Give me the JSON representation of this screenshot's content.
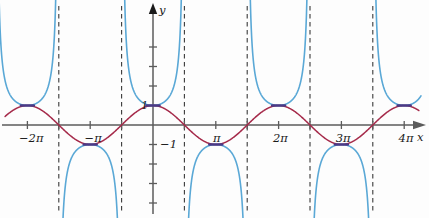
{
  "figure": {
    "background": "#fdfdfd",
    "axis_color": "#5b5b5b",
    "asymptote_color": "#3a3a3a",
    "x_axis_label": "x",
    "y_axis_label": "y"
  },
  "chart_data": {
    "type": "line",
    "title": "",
    "xlabel": "x",
    "ylabel": "y",
    "grid": false,
    "legend": "none",
    "xlim": [
      -7.4,
      13.6
    ],
    "ylim": [
      -4.3,
      4.3
    ],
    "x_tick_values": [
      -6.2832,
      -4.7124,
      -3.1416,
      -1.5708,
      0,
      1.5708,
      3.1416,
      4.7124,
      6.2832,
      7.854,
      9.4248,
      10.9956,
      12.5664
    ],
    "x_tick_labels": [
      "-2π",
      "",
      "-π",
      "",
      "",
      "",
      "π",
      "",
      "2π",
      "",
      "3π",
      "",
      "4π"
    ],
    "x_labeled_ticks": [
      {
        "value": -6.2832,
        "label": "−2π"
      },
      {
        "value": -3.1416,
        "label": "−π"
      },
      {
        "value": 3.1416,
        "label": "π"
      },
      {
        "value": 6.2832,
        "label": "2π"
      },
      {
        "value": 9.4248,
        "label": "3π"
      },
      {
        "value": 12.5664,
        "label": "4π"
      }
    ],
    "y_tick_values": [
      -4,
      -3,
      -2,
      -1,
      1,
      2,
      3,
      4
    ],
    "y_labeled_ticks": [
      {
        "value": 1,
        "label": "1"
      },
      {
        "value": -1,
        "label": "−1"
      }
    ],
    "series": [
      {
        "name": "cosine",
        "expression": "y = cos(x)",
        "color": "#a52a4a",
        "width": 1.5,
        "style": "solid"
      },
      {
        "name": "secant",
        "expression": "y = sec(x)",
        "color": "#5aa8d6",
        "width": 1.6,
        "style": "solid"
      }
    ],
    "asymptotes": {
      "style": "dashed",
      "color": "#3a3a3a",
      "values": [
        -7.854,
        -4.7124,
        -1.5708,
        1.5708,
        4.7124,
        7.854,
        10.9956
      ],
      "labels": [
        "-5π/2",
        "-3π/2",
        "-π/2",
        "π/2",
        "3π/2",
        "5π/2",
        "7π/2"
      ]
    },
    "touch_points": [
      {
        "x": -6.2832,
        "y": 1
      },
      {
        "x": -3.1416,
        "y": -1
      },
      {
        "x": 0,
        "y": 1
      },
      {
        "x": 3.1416,
        "y": -1
      },
      {
        "x": 6.2832,
        "y": 1
      },
      {
        "x": 9.4248,
        "y": -1
      },
      {
        "x": 12.5664,
        "y": 1
      }
    ]
  }
}
